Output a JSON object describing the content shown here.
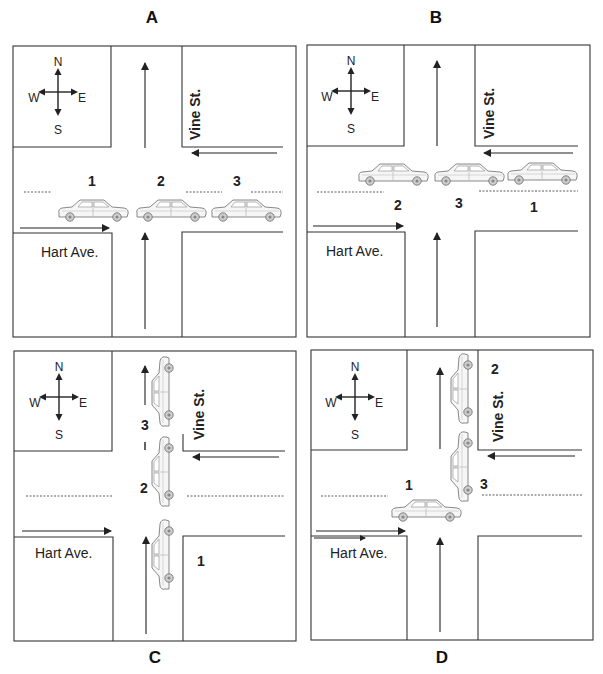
{
  "figure": {
    "panels": [
      {
        "id": "A",
        "label": "A",
        "compass": {
          "n": "N",
          "s": "S",
          "e": "E",
          "w": "W"
        },
        "streets": {
          "horizontal": "Hart Ave.",
          "vertical": "Vine St."
        },
        "cars": [
          {
            "number": "1",
            "orientation": "east"
          },
          {
            "number": "2",
            "orientation": "east"
          },
          {
            "number": "3",
            "orientation": "east"
          }
        ]
      },
      {
        "id": "B",
        "label": "B",
        "compass": {
          "n": "N",
          "s": "S",
          "e": "E",
          "w": "W"
        },
        "streets": {
          "horizontal": "Hart Ave.",
          "vertical": "Vine St."
        },
        "cars": [
          {
            "number": "2",
            "orientation": "east"
          },
          {
            "number": "3",
            "orientation": "east"
          },
          {
            "number": "1",
            "orientation": "east"
          }
        ]
      },
      {
        "id": "C",
        "label": "C",
        "compass": {
          "n": "N",
          "s": "S",
          "e": "E",
          "w": "W"
        },
        "streets": {
          "horizontal": "Hart Ave.",
          "vertical": "Vine St."
        },
        "cars": [
          {
            "number": "3",
            "orientation": "north"
          },
          {
            "number": "2",
            "orientation": "north"
          },
          {
            "number": "1",
            "orientation": "north"
          }
        ],
        "marker": "I"
      },
      {
        "id": "D",
        "label": "D",
        "compass": {
          "n": "N",
          "s": "S",
          "e": "E",
          "w": "W"
        },
        "streets": {
          "horizontal": "Hart Ave.",
          "vertical": "Vine St."
        },
        "cars": [
          {
            "number": "1",
            "orientation": "east"
          },
          {
            "number": "2",
            "orientation": "north"
          },
          {
            "number": "3",
            "orientation": "north"
          }
        ]
      }
    ],
    "colors": {
      "line": "#333333",
      "background": "#ffffff",
      "car_stroke": "#777777",
      "car_fill": "#f4f4f4"
    }
  }
}
